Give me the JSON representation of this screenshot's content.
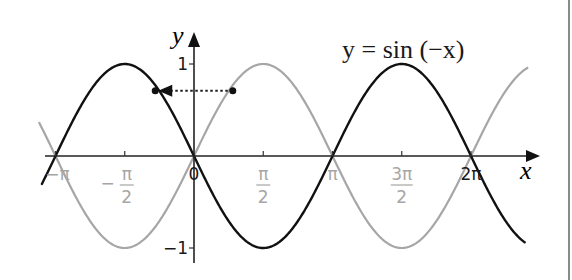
{
  "chart_data": {
    "type": "line",
    "title": "",
    "annotation": "y = sin (−x)",
    "xlabel": "x",
    "ylabel": "y",
    "xlim_radians": [
      -3.49,
      7.58
    ],
    "ylim": [
      -1,
      1
    ],
    "grid": false,
    "legend": "none",
    "x_ticks": [
      {
        "value_pi": -1,
        "label": "−π",
        "num": "",
        "den": "",
        "color": "#a6a6a6"
      },
      {
        "value_pi": -0.5,
        "label": "−π/2",
        "num": "π",
        "den": "2",
        "sign": "−",
        "color": "#a6a6a6"
      },
      {
        "value_pi": 0,
        "label": "0",
        "num": "",
        "den": "",
        "color": "#1a1a1a"
      },
      {
        "value_pi": 0.5,
        "label": "π/2",
        "num": "π",
        "den": "2",
        "color": "#a6a6a6"
      },
      {
        "value_pi": 1,
        "label": "π",
        "num": "",
        "den": "",
        "color": "#a6a6a6"
      },
      {
        "value_pi": 1.5,
        "label": "3π/2",
        "num": "3π",
        "den": "2",
        "color": "#a6a6a6"
      },
      {
        "value_pi": 2,
        "label": "2π",
        "num": "",
        "den": "",
        "color": "#1a1a1a"
      }
    ],
    "y_ticks": [
      {
        "value": 1,
        "label": "1"
      },
      {
        "value": -1,
        "label": "−1"
      }
    ],
    "series": [
      {
        "name": "y = sin(x)",
        "function": "sin(x)",
        "color": "#a6a6a6",
        "stroke_width": 2.2,
        "key_points": [
          [
            -3.1416,
            0
          ],
          [
            -1.5708,
            -1
          ],
          [
            0,
            0
          ],
          [
            1.5708,
            1
          ],
          [
            3.1416,
            0
          ],
          [
            4.7124,
            -1
          ],
          [
            6.2832,
            0
          ]
        ]
      },
      {
        "name": "y = sin(−x)",
        "function": "sin(-x)",
        "color": "#111111",
        "stroke_width": 2.4,
        "key_points": [
          [
            -3.1416,
            0
          ],
          [
            -1.5708,
            1
          ],
          [
            0,
            0
          ],
          [
            1.5708,
            -1
          ],
          [
            3.1416,
            0
          ],
          [
            4.7124,
            1
          ],
          [
            6.2832,
            0
          ]
        ]
      }
    ],
    "reflection_arrow": {
      "from": {
        "x_pi": 0.28,
        "y": 0.72
      },
      "to": {
        "x_pi": -0.28,
        "y": 0.72
      },
      "style": "dotted",
      "description": "point on sin(x) reflected across y-axis onto sin(−x)"
    }
  },
  "labels": {
    "equation": "y = sin (−x)",
    "x_axis": "x",
    "y_axis": "y",
    "y_tick_1": "1",
    "y_tick_neg1": "−1"
  }
}
